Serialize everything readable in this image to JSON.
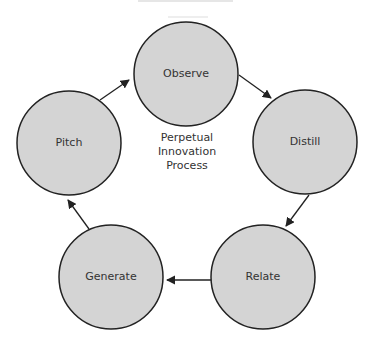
{
  "diagram": {
    "center_title": [
      "Perpetual",
      "Innovation",
      "Process"
    ],
    "nodes": [
      {
        "label": "Observe",
        "cx": 186,
        "cy": 74
      },
      {
        "label": "Distill",
        "cx": 305,
        "cy": 142
      },
      {
        "label": "Relate",
        "cx": 263,
        "cy": 277
      },
      {
        "label": "Generate",
        "cx": 111,
        "cy": 277
      },
      {
        "label": "Pitch",
        "cx": 69,
        "cy": 143
      }
    ],
    "radius": 52,
    "fill_color": "#d4d4d4",
    "stroke_color": "#222222"
  }
}
